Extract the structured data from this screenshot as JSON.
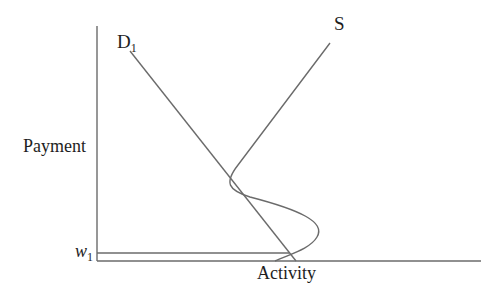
{
  "diagram": {
    "type": "supply-demand",
    "y_axis_label": "Payment",
    "x_axis_label": "Activity",
    "curves": [
      {
        "name": "D",
        "subscript": "1",
        "shape": "straight-downward-sloping"
      },
      {
        "name": "S",
        "subscript": "",
        "shape": "backward-bending-s-curve"
      }
    ],
    "level_marker": {
      "name": "w",
      "subscript": "1"
    },
    "colors": {
      "line": "#6b6b6b",
      "text": "#1e1e1e",
      "background": "#ffffff"
    }
  }
}
